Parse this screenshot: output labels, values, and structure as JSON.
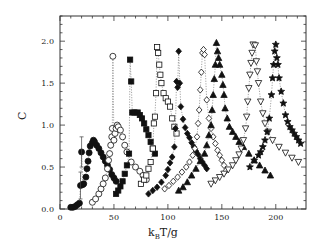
{
  "chart_data": {
    "type": "scatter",
    "title": "",
    "xlabel": "k_B T/g",
    "ylabel": "C",
    "xlim": [
      0,
      228
    ],
    "ylim": [
      0,
      2.3
    ],
    "xticks": [
      0,
      50,
      100,
      150,
      200
    ],
    "yticks": [
      0.0,
      0.5,
      1.0,
      1.5,
      2.0
    ],
    "xtick_labels": [
      "0",
      "50",
      "100",
      "150",
      "200"
    ],
    "ytick_labels": [
      "0.0",
      "0.5",
      "1.0",
      "1.5",
      "2.0"
    ],
    "grid": false,
    "legend": null,
    "series": [
      {
        "name": "filled-circle",
        "marker": "circle",
        "filled": true,
        "points": [
          [
            10,
            0.02
          ],
          [
            12,
            0.02
          ],
          [
            14,
            0.03
          ],
          [
            16,
            0.05
          ],
          [
            18,
            0.07
          ],
          [
            19,
            0.28
          ],
          [
            20,
            0.68
          ],
          [
            21,
            0.29
          ],
          [
            22,
            0.3
          ],
          [
            24,
            0.38
          ],
          [
            25,
            0.48
          ],
          [
            26,
            0.57
          ],
          [
            27,
            0.67
          ],
          [
            28,
            0.75
          ],
          [
            30,
            0.79
          ],
          [
            31,
            0.82
          ],
          [
            32,
            0.8
          ],
          [
            34,
            0.76
          ],
          [
            36,
            0.72
          ],
          [
            38,
            0.67
          ],
          [
            40,
            0.62
          ],
          [
            42,
            0.57
          ],
          [
            44,
            0.52
          ],
          [
            46,
            0.47
          ],
          [
            48,
            0.41
          ],
          [
            50,
            0.37
          ],
          [
            52,
            0.33
          ]
        ]
      },
      {
        "name": "open-circle",
        "marker": "circle",
        "filled": false,
        "points": [
          [
            30,
            0.08
          ],
          [
            33,
            0.12
          ],
          [
            36,
            0.18
          ],
          [
            38,
            0.24
          ],
          [
            40,
            0.3
          ],
          [
            42,
            0.37
          ],
          [
            44,
            0.48
          ],
          [
            45,
            0.58
          ],
          [
            46,
            0.66
          ],
          [
            47,
            0.76
          ],
          [
            48,
            0.86
          ],
          [
            48.5,
            0.96
          ],
          [
            49,
            1.82
          ],
          [
            50,
            0.82
          ],
          [
            51,
            0.9
          ],
          [
            52,
            0.96
          ],
          [
            53,
            1.0
          ],
          [
            54,
            0.98
          ],
          [
            56,
            0.94
          ],
          [
            58,
            0.86
          ],
          [
            60,
            0.76
          ],
          [
            62,
            0.68
          ],
          [
            66,
            0.56
          ],
          [
            70,
            0.5
          ],
          [
            74,
            0.45
          ],
          [
            77,
            0.4
          ],
          [
            80,
            0.35
          ]
        ]
      },
      {
        "name": "filled-square",
        "marker": "square",
        "filled": true,
        "points": [
          [
            52,
            0.18
          ],
          [
            54,
            0.22
          ],
          [
            56,
            0.27
          ],
          [
            58,
            0.33
          ],
          [
            60,
            0.42
          ],
          [
            62,
            0.52
          ],
          [
            64,
            0.66
          ],
          [
            65,
            1.78
          ],
          [
            66,
            1.52
          ],
          [
            67,
            1.15
          ],
          [
            69,
            1.15
          ],
          [
            72,
            1.15
          ],
          [
            74,
            1.12
          ],
          [
            76,
            1.08
          ],
          [
            78,
            1.02
          ],
          [
            80,
            0.95
          ],
          [
            82,
            0.88
          ],
          [
            84,
            0.8
          ],
          [
            86,
            0.72
          ],
          [
            88,
            0.66
          ]
        ]
      },
      {
        "name": "open-square",
        "marker": "square",
        "filled": false,
        "points": [
          [
            75,
            0.3
          ],
          [
            78,
            0.35
          ],
          [
            80,
            0.4
          ],
          [
            82,
            0.48
          ],
          [
            84,
            0.56
          ],
          [
            86,
            0.72
          ],
          [
            87,
            1.02
          ],
          [
            88,
            1.1
          ],
          [
            89,
            1.38
          ],
          [
            90,
            1.93
          ],
          [
            91,
            1.86
          ],
          [
            92,
            1.72
          ],
          [
            93,
            1.6
          ],
          [
            94,
            1.5
          ],
          [
            96,
            1.38
          ],
          [
            98,
            1.32
          ],
          [
            100,
            1.28
          ],
          [
            102,
            1.22
          ],
          [
            104,
            1.08
          ],
          [
            106,
            0.98
          ],
          [
            108,
            0.9
          ]
        ]
      },
      {
        "name": "filled-diamond",
        "marker": "diamond",
        "filled": true,
        "points": [
          [
            82,
            0.18
          ],
          [
            86,
            0.22
          ],
          [
            90,
            0.26
          ],
          [
            94,
            0.32
          ],
          [
            98,
            0.4
          ],
          [
            100,
            0.47
          ],
          [
            102,
            0.55
          ],
          [
            104,
            0.62
          ],
          [
            106,
            0.74
          ],
          [
            107,
            0.96
          ],
          [
            108,
            1.52
          ],
          [
            109,
            1.45
          ],
          [
            110,
            1.88
          ],
          [
            111,
            1.5
          ],
          [
            112,
            1.22
          ],
          [
            114,
            1.07
          ],
          [
            116,
            0.97
          ],
          [
            118,
            0.9
          ],
          [
            120,
            0.85
          ],
          [
            122,
            0.79
          ],
          [
            124,
            0.74
          ],
          [
            126,
            0.69
          ],
          [
            128,
            0.65
          ],
          [
            130,
            0.6
          ],
          [
            132,
            0.56
          ],
          [
            134,
            0.52
          ],
          [
            136,
            0.48
          ]
        ]
      },
      {
        "name": "open-diamond",
        "marker": "diamond",
        "filled": false,
        "points": [
          [
            97,
            0.24
          ],
          [
            101,
            0.28
          ],
          [
            105,
            0.33
          ],
          [
            109,
            0.38
          ],
          [
            113,
            0.44
          ],
          [
            117,
            0.5
          ],
          [
            120,
            0.56
          ],
          [
            123,
            0.64
          ],
          [
            125,
            0.72
          ],
          [
            127,
            0.86
          ],
          [
            128,
            1.02
          ],
          [
            129,
            1.18
          ],
          [
            130,
            1.42
          ],
          [
            131,
            1.63
          ],
          [
            132,
            1.86
          ],
          [
            133,
            1.9
          ],
          [
            134,
            1.84
          ],
          [
            136,
            1.3
          ],
          [
            138,
            1.08
          ],
          [
            140,
            0.96
          ],
          [
            142,
            0.86
          ],
          [
            144,
            0.78
          ],
          [
            146,
            0.7
          ],
          [
            148,
            0.64
          ],
          [
            150,
            0.58
          ],
          [
            152,
            0.52
          ],
          [
            154,
            0.46
          ]
        ]
      },
      {
        "name": "filled-triangle-up",
        "marker": "triangle-up",
        "filled": true,
        "points": [
          [
            110,
            0.22
          ],
          [
            114,
            0.26
          ],
          [
            118,
            0.32
          ],
          [
            122,
            0.4
          ],
          [
            126,
            0.48
          ],
          [
            130,
            0.57
          ],
          [
            134,
            0.66
          ],
          [
            136,
            0.76
          ],
          [
            138,
            0.88
          ],
          [
            140,
            1.0
          ],
          [
            141,
            1.18
          ],
          [
            142,
            1.36
          ],
          [
            143,
            1.55
          ],
          [
            144,
            1.72
          ],
          [
            145,
            1.98
          ],
          [
            146,
            1.88
          ],
          [
            147,
            1.8
          ],
          [
            148,
            1.72
          ],
          [
            150,
            1.6
          ],
          [
            151,
            1.48
          ],
          [
            152,
            1.36
          ],
          [
            153,
            1.2
          ],
          [
            155,
            1.08
          ],
          [
            157,
            0.98
          ],
          [
            160,
            0.92
          ],
          [
            163,
            0.86
          ],
          [
            166,
            0.8
          ],
          [
            170,
            0.74
          ],
          [
            175,
            0.66
          ],
          [
            180,
            0.58
          ],
          [
            185,
            0.52
          ],
          [
            190,
            0.46
          ],
          [
            195,
            0.4
          ]
        ]
      },
      {
        "name": "open-triangle-down",
        "marker": "triangle-down",
        "filled": false,
        "points": [
          [
            140,
            0.3
          ],
          [
            144,
            0.34
          ],
          [
            148,
            0.38
          ],
          [
            152,
            0.42
          ],
          [
            156,
            0.47
          ],
          [
            160,
            0.52
          ],
          [
            163,
            0.58
          ],
          [
            166,
            0.65
          ],
          [
            168,
            0.72
          ],
          [
            170,
            0.82
          ],
          [
            172,
            0.96
          ],
          [
            173,
            1.1
          ],
          [
            174,
            1.28
          ],
          [
            175,
            1.44
          ],
          [
            176,
            1.6
          ],
          [
            177,
            1.74
          ],
          [
            178,
            1.86
          ],
          [
            179,
            1.96
          ],
          [
            181,
            1.95
          ],
          [
            182,
            1.76
          ],
          [
            183,
            1.64
          ],
          [
            184,
            1.5
          ],
          [
            186,
            1.28
          ],
          [
            188,
            1.14
          ],
          [
            190,
            1.02
          ],
          [
            193,
            0.92
          ],
          [
            197,
            0.82
          ],
          [
            203,
            0.74
          ],
          [
            209,
            0.67
          ],
          [
            215,
            0.61
          ],
          [
            221,
            0.56
          ]
        ]
      },
      {
        "name": "filled-star",
        "marker": "star",
        "filled": true,
        "points": [
          [
            176,
            0.5
          ],
          [
            180,
            0.58
          ],
          [
            184,
            0.64
          ],
          [
            186,
            0.68
          ],
          [
            188,
            0.74
          ],
          [
            190,
            0.82
          ],
          [
            192,
            0.92
          ],
          [
            194,
            1.08
          ],
          [
            196,
            1.36
          ],
          [
            197,
            1.56
          ],
          [
            198,
            1.72
          ],
          [
            199,
            1.88
          ],
          [
            200,
            1.96
          ],
          [
            201,
            1.8
          ],
          [
            202,
            1.72
          ],
          [
            203,
            1.56
          ],
          [
            205,
            1.4
          ],
          [
            207,
            1.26
          ],
          [
            209,
            1.12
          ],
          [
            211,
            1.04
          ],
          [
            213,
            0.98
          ],
          [
            215,
            0.94
          ],
          [
            217,
            0.9
          ],
          [
            219,
            0.86
          ],
          [
            221,
            0.82
          ],
          [
            223,
            0.78
          ]
        ]
      }
    ]
  }
}
